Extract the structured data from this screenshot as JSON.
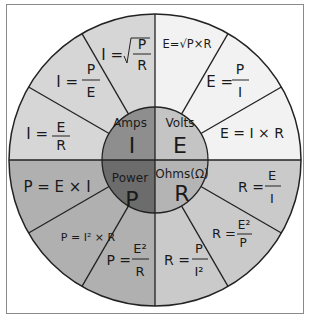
{
  "diagram": {
    "colors": {
      "amps_center": "#8e8e8e",
      "volts_center": "#c4c4c4",
      "power_center": "#6c6c6c",
      "ohms_center": "#b4b4b4",
      "amps_ring": "#d6d6d6",
      "volts_ring": "#f2f2f2",
      "power_ring": "#b0b0b0",
      "ohms_ring": "#cacaca",
      "stroke": "#222222"
    },
    "quadrants": {
      "amps": {
        "label": "Amps",
        "symbol": "I"
      },
      "volts": {
        "label": "Volts",
        "symbol": "E"
      },
      "power": {
        "label": "Power",
        "symbol": "P"
      },
      "ohms": {
        "label": "Ohms(Ω)",
        "symbol": "R"
      }
    },
    "formulas": {
      "amps": [
        {
          "lhs": "I =",
          "num": "E",
          "den": "R"
        },
        {
          "lhs": "I =",
          "num": "P",
          "den": "E"
        },
        {
          "lhs": "I =",
          "sqrt_num": "P",
          "sqrt_den": "R"
        }
      ],
      "volts": [
        {
          "text": "E=√P×R"
        },
        {
          "lhs": "E =",
          "num": "P",
          "den": "I"
        },
        {
          "text": "E = I × R"
        }
      ],
      "ohms": [
        {
          "lhs": "R =",
          "num": "E",
          "den": "I"
        },
        {
          "lhs": "R =",
          "num": "E²",
          "den": "P"
        },
        {
          "lhs": "R =",
          "num": "P",
          "den": "I²"
        }
      ],
      "power": [
        {
          "lhs": "P =",
          "num": "E²",
          "den": "R"
        },
        {
          "text": "P = I² × R"
        },
        {
          "text": "P = E × I"
        }
      ]
    }
  }
}
